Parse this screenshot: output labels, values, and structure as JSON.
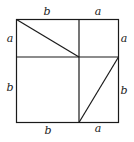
{
  "diagram": {
    "type": "geometric-proof",
    "outer_square": {
      "side_label": "a + b"
    },
    "labels": {
      "top_left": "b",
      "top_right": "a",
      "left_top": "a",
      "left_bottom": "b",
      "right_top": "a",
      "right_bottom": "b",
      "bottom_left": "b",
      "bottom_right": "a"
    },
    "colors": {
      "stroke": "#1a1a1a",
      "background": "#ffffff"
    }
  }
}
